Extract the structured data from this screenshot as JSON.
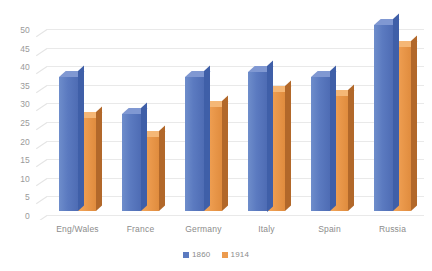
{
  "chart_data": {
    "type": "bar",
    "title": "",
    "subtitle": "",
    "xlabel": "",
    "ylabel": "",
    "ylim": [
      0,
      50
    ],
    "ytick_step": 5,
    "yticks": [
      50,
      45,
      40,
      35,
      30,
      25,
      20,
      15,
      10,
      5,
      0
    ],
    "grid": true,
    "legend_position": "bottom",
    "style": "3d-clustered-column",
    "categories": [
      "Eng/Wales",
      "France",
      "Germany",
      "Italy",
      "Spain",
      "Russia"
    ],
    "series": [
      {
        "name": "1860",
        "color": "#5B7AC0",
        "values": [
          36,
          26,
          36,
          37.5,
          36,
          50
        ]
      },
      {
        "name": "1914",
        "color": "#EC9B4E",
        "values": [
          25,
          20,
          28,
          32,
          31,
          44
        ]
      }
    ]
  },
  "legend": {
    "items": [
      {
        "label": "1860",
        "color": "#5B7AC0"
      },
      {
        "label": "1914",
        "color": "#EC9B4E"
      }
    ]
  },
  "colors": {
    "background": "#FFFFFF",
    "gridline": "#E8E8E8",
    "axis_text": "#9A9A9A",
    "category_text": "#8C8C8C",
    "series_1860": "#5B7AC0",
    "series_1914": "#EC9B4E"
  }
}
